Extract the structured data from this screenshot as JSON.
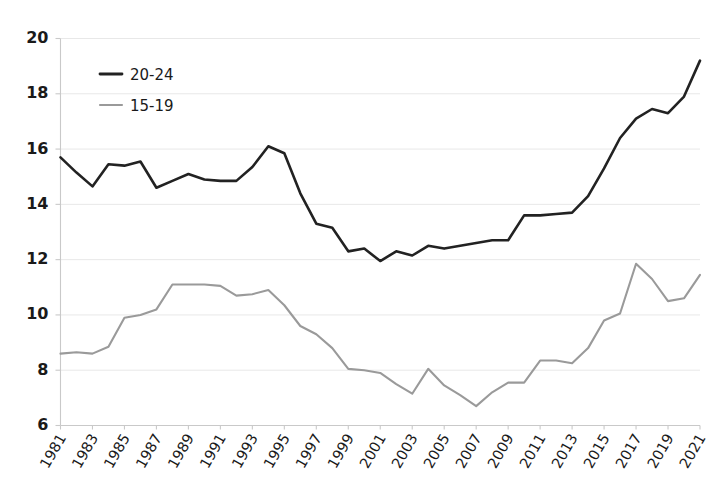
{
  "chart_data": {
    "type": "line",
    "title": "",
    "subtitle": "",
    "xlabel": "",
    "ylabel": "",
    "xlim": [
      1981,
      2021
    ],
    "ylim": [
      6,
      20
    ],
    "yticks": [
      6,
      8,
      10,
      12,
      14,
      16,
      18,
      20
    ],
    "xticks": [
      1981,
      1983,
      1985,
      1987,
      1989,
      1991,
      1993,
      1995,
      1997,
      1999,
      2001,
      2003,
      2005,
      2007,
      2009,
      2011,
      2013,
      2015,
      2017,
      2019,
      2021
    ],
    "xtick_rotation_deg": 60,
    "grid": "horizontal",
    "legend_position": "top-left",
    "x": [
      1981,
      1982,
      1983,
      1984,
      1985,
      1986,
      1987,
      1988,
      1989,
      1990,
      1991,
      1992,
      1993,
      1994,
      1995,
      1996,
      1997,
      1998,
      1999,
      2000,
      2001,
      2002,
      2003,
      2004,
      2005,
      2006,
      2007,
      2008,
      2009,
      2010,
      2011,
      2012,
      2013,
      2014,
      2015,
      2016,
      2017,
      2018,
      2019,
      2020,
      2021
    ],
    "series": [
      {
        "name": "20-24",
        "color": "#222222",
        "width": 2.6,
        "values": [
          15.7,
          15.15,
          14.65,
          15.45,
          15.4,
          15.55,
          14.6,
          14.85,
          15.1,
          14.9,
          14.85,
          14.85,
          15.35,
          16.1,
          15.85,
          14.4,
          13.3,
          13.15,
          12.3,
          12.4,
          11.95,
          12.3,
          12.15,
          12.5,
          12.4,
          12.5,
          12.6,
          12.7,
          12.7,
          13.6,
          13.6,
          13.65,
          13.7,
          14.3,
          15.3,
          16.4,
          17.1,
          17.45,
          17.3,
          17.9,
          19.2
        ]
      },
      {
        "name": "15-19",
        "color": "#9a9a9a",
        "width": 2.1,
        "values": [
          8.6,
          8.65,
          8.6,
          8.85,
          9.9,
          10.0,
          10.2,
          11.1,
          11.1,
          11.1,
          11.05,
          10.7,
          10.75,
          10.9,
          10.35,
          9.6,
          9.3,
          8.8,
          8.05,
          8.0,
          7.9,
          7.5,
          7.15,
          8.05,
          7.45,
          7.1,
          6.7,
          7.2,
          7.55,
          7.55,
          8.35,
          8.35,
          8.25,
          8.8,
          9.8,
          10.05,
          11.85,
          11.3,
          10.5,
          10.6,
          11.45
        ]
      }
    ],
    "legend": [
      {
        "label": "20-24",
        "color": "#222222"
      },
      {
        "label": "15-19",
        "color": "#9a9a9a"
      }
    ]
  }
}
